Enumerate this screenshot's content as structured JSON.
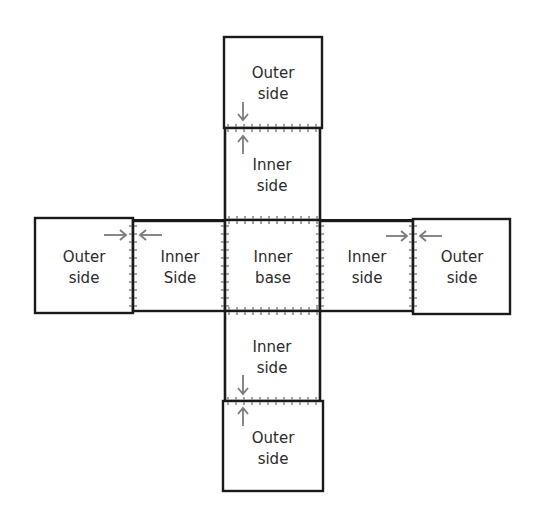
{
  "diagram": {
    "type": "box-net-sewing-layout",
    "panels": [
      {
        "id": "top-outer",
        "line1": "Outer",
        "line2": "side"
      },
      {
        "id": "top-inner",
        "line1": "Inner",
        "line2": "side"
      },
      {
        "id": "left-outer",
        "line1": "Outer",
        "line2": "side"
      },
      {
        "id": "left-inner",
        "line1": "Inner",
        "line2": "Side"
      },
      {
        "id": "center-base",
        "line1": "Inner",
        "line2": "base"
      },
      {
        "id": "right-inner",
        "line1": "Inner",
        "line2": "side"
      },
      {
        "id": "right-outer",
        "line1": "Outer",
        "line2": "side"
      },
      {
        "id": "bottom-inner",
        "line1": "Inner",
        "line2": "side"
      },
      {
        "id": "bottom-outer",
        "line1": "Outer",
        "line2": "side"
      }
    ],
    "colors": {
      "outline": "#1a1a1a",
      "stitch": "#8a8a8a",
      "arrow": "#7a7a7a",
      "text": "#2a2a2a",
      "background": "#ffffff"
    }
  }
}
